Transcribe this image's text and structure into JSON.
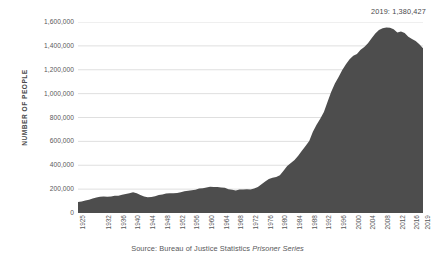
{
  "chart_data": {
    "type": "area",
    "title": "",
    "xlabel": "",
    "ylabel": "NUMBER OF PEOPLE",
    "ylim": [
      0,
      1600000
    ],
    "xlim": [
      1925,
      2019
    ],
    "grid": true,
    "legend": "none",
    "series_color": "#4d4d4d",
    "annotations": [
      {
        "name": "endpoint-callout",
        "text": "2019: 1,380,427",
        "year": 2019,
        "value": 1380427
      }
    ],
    "ytick_labels": [
      "0",
      "200,000",
      "400,000",
      "600,000",
      "800,000",
      "1,000,000",
      "1,200,000",
      "1,400,000",
      "1,600,000"
    ],
    "ytick_values": [
      0,
      200000,
      400000,
      600000,
      800000,
      1000000,
      1200000,
      1400000,
      1600000
    ],
    "xtick_labels": [
      "1925",
      "1932",
      "1936",
      "1940",
      "1944",
      "1948",
      "1952",
      "1956",
      "1960",
      "1964",
      "1968",
      "1972",
      "1976",
      "1980",
      "1984",
      "1988",
      "1992",
      "1996",
      "2000",
      "2004",
      "2008",
      "2012",
      "2016",
      "2019"
    ],
    "xtick_values": [
      1925,
      1932,
      1936,
      1940,
      1944,
      1948,
      1952,
      1956,
      1960,
      1964,
      1968,
      1972,
      1976,
      1980,
      1984,
      1988,
      1992,
      1996,
      2000,
      2004,
      2008,
      2012,
      2016,
      2019
    ],
    "x": [
      1925,
      1926,
      1927,
      1928,
      1929,
      1930,
      1931,
      1932,
      1933,
      1934,
      1935,
      1936,
      1937,
      1938,
      1939,
      1940,
      1941,
      1942,
      1943,
      1944,
      1945,
      1946,
      1947,
      1948,
      1949,
      1950,
      1951,
      1952,
      1953,
      1954,
      1955,
      1956,
      1957,
      1958,
      1959,
      1960,
      1961,
      1962,
      1963,
      1964,
      1965,
      1966,
      1967,
      1968,
      1969,
      1970,
      1971,
      1972,
      1973,
      1974,
      1975,
      1976,
      1977,
      1978,
      1979,
      1980,
      1981,
      1982,
      1983,
      1984,
      1985,
      1986,
      1987,
      1988,
      1989,
      1990,
      1991,
      1992,
      1993,
      1994,
      1995,
      1996,
      1997,
      1998,
      1999,
      2000,
      2001,
      2002,
      2003,
      2004,
      2005,
      2006,
      2007,
      2008,
      2009,
      2010,
      2011,
      2012,
      2013,
      2014,
      2015,
      2016,
      2017,
      2018,
      2019
    ],
    "values": [
      91669,
      97000,
      104983,
      110000,
      120496,
      129453,
      137000,
      137997,
      136000,
      138316,
      144180,
      145038,
      152000,
      159000,
      165585,
      173706,
      165439,
      150384,
      137220,
      132456,
      133649,
      140079,
      151304,
      155977,
      163749,
      166123,
      165680,
      168233,
      173579,
      182901,
      185780,
      189565,
      195414,
      205643,
      208105,
      212953,
      220149,
      218830,
      217283,
      214336,
      210895,
      199654,
      194896,
      187914,
      196007,
      196429,
      198061,
      196092,
      204211,
      218466,
      240593,
      262833,
      285456,
      294396,
      301470,
      315974,
      353167,
      394374,
      419820,
      443398,
      480568,
      522084,
      560812,
      603732,
      680907,
      739980,
      789610,
      846277,
      932074,
      1016691,
      1085022,
      1138984,
      1197590,
      1245402,
      1287172,
      1316333,
      1330980,
      1367856,
      1390279,
      1421911,
      1462866,
      1504598,
      1532851,
      1547742,
      1553574,
      1552669,
      1538847,
      1511581,
      1520403,
      1508636,
      1476847,
      1458173,
      1439808,
      1414166,
      1380427
    ],
    "caption": {
      "prefix": "Source: Bureau of Justice Statistics ",
      "italic": "Prisoner Series"
    }
  }
}
